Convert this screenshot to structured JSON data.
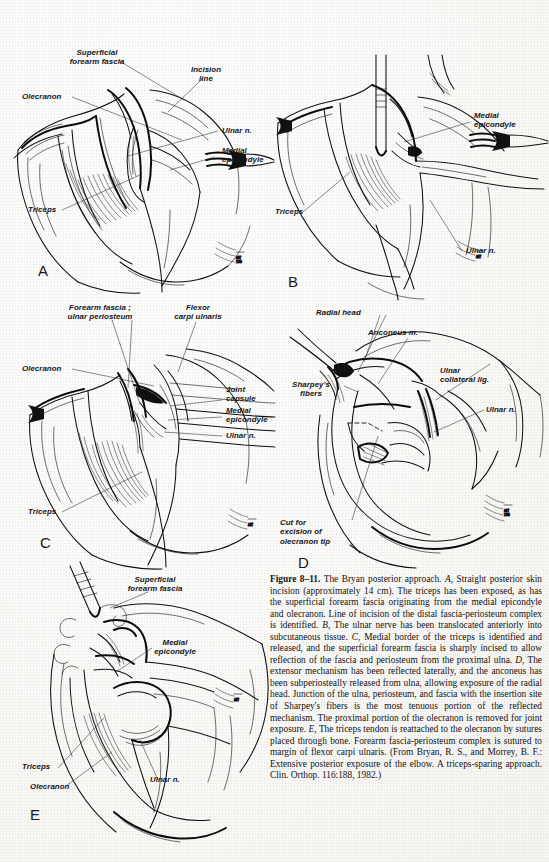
{
  "figure": {
    "number": "Figure 8–11.",
    "panel_letters": [
      "A",
      "B",
      "C",
      "D",
      "E"
    ]
  },
  "panels": {
    "A": {
      "letter": "A",
      "labels": [
        "Superficial\nforearm fascia",
        "Incision\nline",
        "Olecranon",
        "Ulnar n.",
        "Medial\nepicondyle",
        "Triceps"
      ]
    },
    "B": {
      "letter": "B",
      "labels": [
        "Medial\nepicondyle",
        "Triceps",
        "Ulnar n."
      ]
    },
    "C": {
      "letter": "C",
      "labels": [
        "Forearm fascia ;\nulnar periosteum",
        "Flexor\ncarpi ulnaris",
        "Olecranon",
        "Joint\ncapsule",
        "Medial\nepicondyle",
        "Ulnar n.",
        "Triceps"
      ]
    },
    "D": {
      "letter": "D",
      "labels": [
        "Radial head",
        "Anconeus m.",
        "Ulnar\ncollateral lig.",
        "Sharpey's\nfibers",
        "Ulnar n.",
        "Cut for\nexcision of\nolecranon tip"
      ]
    },
    "E": {
      "letter": "E",
      "labels": [
        "Superficial\nforearm fascia",
        "Medial\nepicondyle",
        "Triceps",
        "Ulnar n.",
        "Olecranon"
      ]
    }
  },
  "labels": {
    "a_superficial_forearm_fascia": "Superficial\nforearm fascia",
    "a_incision_line": "Incision\nline",
    "a_olecranon": "Olecranon",
    "a_ulnar_n": "Ulnar n.",
    "a_medial_epicondyle": "Medial\nepicondyle",
    "a_triceps": "Triceps",
    "b_medial_epicondyle": "Medial\nepicondyle",
    "b_triceps": "Triceps",
    "b_ulnar_n": "Ulnar n.",
    "c_forearm_fascia_ulnar_periosteum": "Forearm fascia ;\nulnar periosteum",
    "c_flexor_carpi_ulnaris": "Flexor\ncarpi ulnaris",
    "c_olecranon": "Olecranon",
    "c_joint_capsule": "Joint\ncapsule",
    "c_medial_epicondyle": "Medial\nepicondyle",
    "c_ulnar_n": "Ulnar n.",
    "c_triceps": "Triceps",
    "d_radial_head": "Radial head",
    "d_anconeus_m": "Anconeus m.",
    "d_ulnar_collateral_lig": "Ulnar\ncollateral lig.",
    "d_sharpeys_fibers": "Sharpey's\nfibers",
    "d_ulnar_n": "Ulnar n.",
    "d_cut_for_excision": "Cut for\nexcision of\nolecranon tip",
    "e_superficial_forearm_fascia": "Superficial\nforearm fascia",
    "e_medial_epicondyle": "Medial\nepicondyle",
    "e_triceps": "Triceps",
    "e_ulnar_n": "Ulnar n.",
    "e_olecranon": "Olecranon"
  },
  "panel_letters": {
    "a": "A",
    "b": "B",
    "c": "C",
    "d": "D",
    "e": "E"
  },
  "caption": {
    "figure_number": "Figure 8–11.",
    "title": " The Bryan posterior approach. ",
    "a_marker": "A,",
    "a_text": " Straight posterior skin incision (approximately 14 cm). The triceps has been exposed, as has the superficial forearm fascia originating from the medial epicondyle and olecranon. Line of incision of the distal fascia-periosteum complex is identified. ",
    "b_marker": "B,",
    "b_text": " The ulnar nerve has been translocated anteriorly into subcutaneous tissue. ",
    "c_marker": "C,",
    "c_text": " Medial border of the triceps is identified and released, and the superficial forearm fascia is sharply incised to allow reflection of the fascia and periosteum from the proximal ulna. ",
    "d_marker": "D,",
    "d_text": " The extensor mechanism has been reflected laterally, and the anconeus has been subperiosteally released from ulna, allowing exposure of the radial head. Junction of the ulna, periosteum, and fascia with the insertion site of Sharpey's fibers is the most tenuous portion of the reflected mechanism. The proximal portion of the olecranon is removed for joint exposure. ",
    "e_marker": "E,",
    "e_text": " The triceps tendon is reattached to the olecranon by sutures placed through bone. Forearm fascia-periosteum complex is sutured to margin of flexor carpi ulnaris. ",
    "source": "(From Bryan, R. S., and Morrey, B. F.: Extensive posterior exposure of the elbow. A triceps-sparing approach. Clin. Orthop. 116:188, 1982.)"
  },
  "colors": {
    "page_background": "#fbfbf9",
    "ink": "#111111",
    "text": "#141414"
  }
}
